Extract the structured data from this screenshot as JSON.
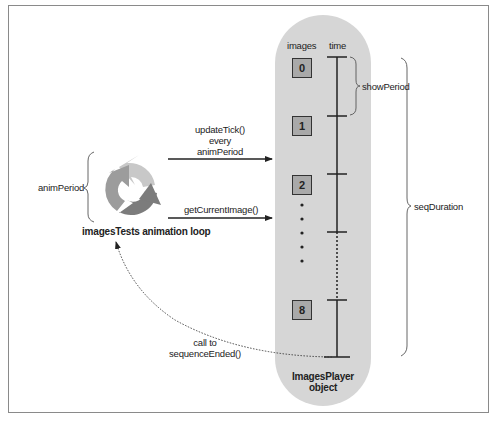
{
  "diagram": {
    "loop": {
      "title": "imagesTests animation loop",
      "period_label": "animPeriod",
      "icon": "refresh-cycle-icon"
    },
    "calls": [
      {
        "label_lines": [
          "updateTick()",
          "every",
          "animPeriod"
        ]
      },
      {
        "label_lines": [
          "getCurrentImage()"
        ]
      }
    ],
    "callback": {
      "label_lines": [
        "call to",
        "sequenceEnded()"
      ]
    },
    "player": {
      "title_lines": [
        "ImagesPlayer",
        "object"
      ],
      "col_images": "images",
      "col_time": "time",
      "frames": [
        "0",
        "1",
        "2",
        "8"
      ],
      "show_period_label": "showPeriod",
      "seq_duration_label": "seqDuration"
    },
    "colors": {
      "capsule": "#d6d6d6",
      "box_fill": "#a9a9a9",
      "arrow_light": "#c8c8c8",
      "arrow_mid": "#9a9a9a",
      "arrow_dark": "#7a7a7a",
      "line": "#222222"
    }
  }
}
